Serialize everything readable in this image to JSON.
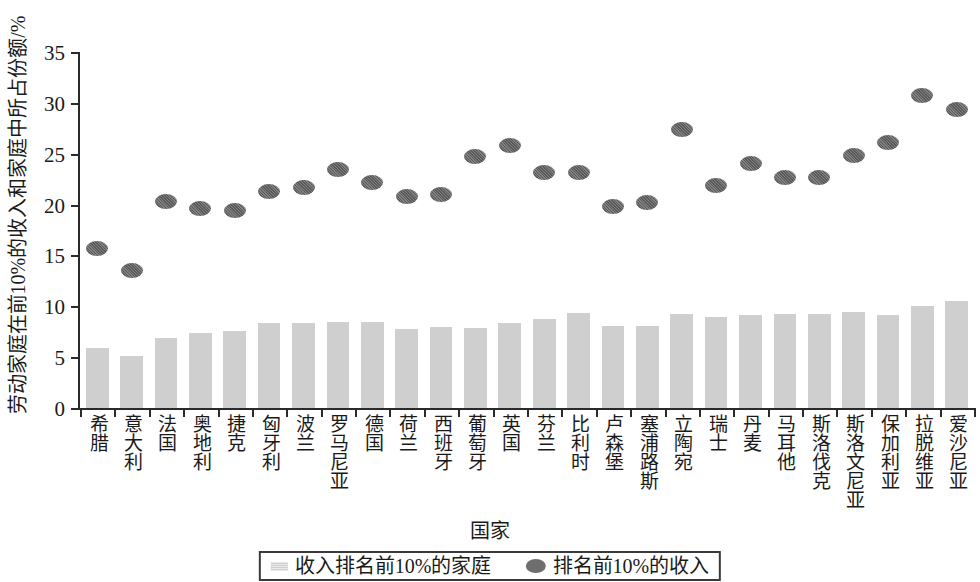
{
  "chart_data": {
    "type": "bar",
    "title": "",
    "xlabel": "国家",
    "ylabel": "劳动家庭在前10%的收入和家庭中所占份额/%",
    "ylim": [
      0,
      35
    ],
    "ytick_labels": [
      "0",
      "5",
      "10",
      "15",
      "20",
      "25",
      "30",
      "35"
    ],
    "yticks": [
      0,
      5,
      10,
      15,
      20,
      25,
      30,
      35
    ],
    "grid": false,
    "legend_position": "bottom-center",
    "categories": [
      "希腊",
      "意大利",
      "法国",
      "奥地利",
      "捷克",
      "匈牙利",
      "波兰",
      "罗马尼亚",
      "德国",
      "荷兰",
      "西班牙",
      "葡萄牙",
      "英国",
      "芬兰",
      "比利时",
      "卢森堡",
      "塞浦路斯",
      "立陶宛",
      "瑞士",
      "丹麦",
      "马耳他",
      "斯洛伐克",
      "斯洛文尼亚",
      "保加利亚",
      "拉脱维亚",
      "爱沙尼亚"
    ],
    "series": [
      {
        "name": "收入排名前10%的家庭",
        "type": "bar",
        "color": "#cfcfcf",
        "values": [
          5.9,
          5.1,
          6.9,
          7.4,
          7.6,
          8.4,
          8.4,
          8.5,
          8.5,
          7.8,
          8.0,
          7.9,
          8.4,
          8.8,
          9.3,
          8.1,
          8.1,
          9.2,
          8.9,
          9.1,
          9.2,
          9.2,
          9.4,
          9.1,
          10.0,
          10.5
        ]
      },
      {
        "name": "排名前10%的收入",
        "type": "scatter",
        "color": "#6e6e6e",
        "values": [
          15.7,
          13.5,
          20.3,
          19.6,
          19.4,
          21.3,
          21.7,
          23.4,
          22.2,
          20.8,
          21.0,
          24.7,
          25.8,
          23.2,
          23.2,
          19.8,
          20.2,
          27.4,
          21.9,
          24.0,
          22.7,
          22.7,
          24.8,
          26.1,
          30.7,
          29.3
        ]
      }
    ]
  },
  "legend": {
    "items": [
      {
        "label": "收入排名前10%的家庭",
        "marker": "bar-swatch-icon"
      },
      {
        "label": "排名前10%的收入",
        "marker": "dot-swatch-icon"
      }
    ]
  }
}
